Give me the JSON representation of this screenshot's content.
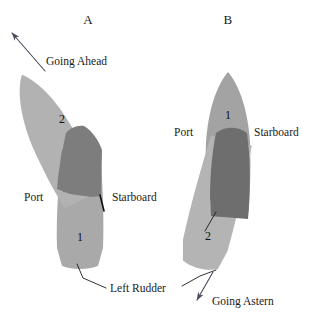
{
  "figure": {
    "title": "",
    "background_color": "#ffffff",
    "ink_color": "#1a1a1a",
    "width": 320,
    "height": 316
  },
  "palette": {
    "hull_light": "#b0b0b0",
    "hull_medium": "#a0a0a0",
    "hull_overlap_dark": "#7d7d7d",
    "outline": "#1a1a1a",
    "arrow": "#4a4a5a"
  },
  "panels": [
    {
      "id": "panel-a",
      "label": "A",
      "label_x": 88,
      "label_y": 24,
      "motion_label": "Going Ahead",
      "motion_label_x": 48,
      "motion_label_y": 64,
      "arrow": {
        "name": "going-ahead-arrow",
        "x1": 44,
        "y1": 70,
        "x2": 8,
        "y2": 30,
        "direction": "up-left"
      },
      "port_label": "Port",
      "port_label_x": 24,
      "port_label_y": 200,
      "starboard_label": "Starboard",
      "starboard_label_x": 112,
      "starboard_label_y": 200,
      "hull_sections": [
        {
          "name": "hull-section-2",
          "number": "2",
          "number_x": 62,
          "number_y": 123,
          "shade": "#b0b0b0",
          "description": "bow section rotated to port (upper)"
        },
        {
          "name": "hull-section-1",
          "number": "1",
          "number_x": 80,
          "number_y": 240,
          "shade": "#a8a8a8",
          "description": "stern section upright (lower)"
        },
        {
          "name": "hull-overlap",
          "number": "",
          "shade": "#7d7d7d",
          "description": "overlap of section 1 and section 2"
        }
      ],
      "rudder_label": "Left Rudder",
      "rudder_label_x": 110,
      "rudder_label_y": 292,
      "rudder_leader": {
        "name": "left-rudder-leader",
        "x1": 106,
        "y1": 288,
        "x2": 80,
        "y2": 268
      },
      "rudder_tick": {
        "name": "rudder-blade-tick-a",
        "x1": 101,
        "y1": 195,
        "x2": 104,
        "y2": 211
      }
    },
    {
      "id": "panel-b",
      "label": "B",
      "label_x": 228,
      "label_y": 24,
      "motion_label": "Going Astern",
      "motion_label_x": 233,
      "motion_label_y": 303,
      "arrow": {
        "name": "going-astern-arrow",
        "x1": 216,
        "y1": 272,
        "x2": 196,
        "y2": 302,
        "direction": "down-left"
      },
      "port_label": "Port",
      "port_label_x": 174,
      "port_label_y": 135,
      "starboard_label": "Starboard",
      "starboard_label_x": 255,
      "starboard_label_y": 135,
      "hull_sections": [
        {
          "name": "hull-section-1",
          "number": "1",
          "number_x": 228,
          "number_y": 118,
          "shade": "#a0a0a0",
          "description": "bow section upright (upper)"
        },
        {
          "name": "hull-section-2",
          "number": "2",
          "number_x": 209,
          "number_y": 238,
          "shade": "#b4b4b4",
          "description": "stern section swung to port (lower)"
        },
        {
          "name": "hull-overlap",
          "number": "",
          "shade": "#6f6f6f",
          "description": "overlap of section 1 and section 2"
        }
      ],
      "rudder_leader": {
        "name": "rudder-leader-b",
        "x1": 206,
        "y1": 230,
        "x2": 215,
        "y2": 212
      }
    }
  ]
}
